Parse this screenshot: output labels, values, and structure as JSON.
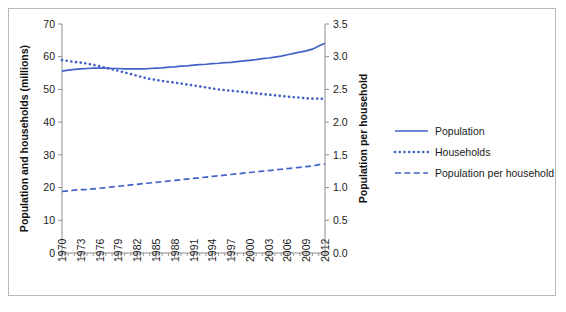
{
  "figure": {
    "border_color": "#b9b9b9",
    "background": "#ffffff",
    "axis_color": "#8d8d8d"
  },
  "chart_data": {
    "type": "line",
    "title": "",
    "subtitle": "",
    "xlabel": "",
    "ylabel": "Population and households (millions)",
    "y2label": "Population per household",
    "ylim": [
      0,
      70
    ],
    "y2lim": [
      0,
      3.5
    ],
    "xlim": [
      1970,
      2012
    ],
    "grid": false,
    "legend_position": "right",
    "y_ticks": [
      "0",
      "10",
      "20",
      "30",
      "40",
      "50",
      "60",
      "70"
    ],
    "y_tick_values": [
      0,
      10,
      20,
      30,
      40,
      50,
      60,
      70
    ],
    "y2_ticks": [
      "0.0",
      "0.5",
      "1.0",
      "1.5",
      "2.0",
      "2.5",
      "3.0",
      "3.5"
    ],
    "y2_tick_values": [
      0,
      0.5,
      1.0,
      1.5,
      2.0,
      2.5,
      3.0,
      3.5
    ],
    "x_tick_labels": [
      "1970",
      "1973",
      "1976",
      "1979",
      "1982",
      "1985",
      "1988",
      "1991",
      "1994",
      "1997",
      "2000",
      "2003",
      "2006",
      "2009",
      "2012"
    ],
    "x_tick_values": [
      1970,
      1973,
      1976,
      1979,
      1982,
      1985,
      1988,
      1991,
      1994,
      1997,
      2000,
      2003,
      2006,
      2009,
      2012
    ],
    "x": [
      1970,
      1971,
      1972,
      1973,
      1974,
      1975,
      1976,
      1977,
      1978,
      1979,
      1980,
      1981,
      1982,
      1983,
      1984,
      1985,
      1986,
      1987,
      1988,
      1989,
      1990,
      1991,
      1992,
      1993,
      1994,
      1995,
      1996,
      1997,
      1998,
      1999,
      2000,
      2001,
      2002,
      2003,
      2004,
      2005,
      2006,
      2007,
      2008,
      2009,
      2010,
      2011,
      2012
    ],
    "series": [
      {
        "name": "Population",
        "axis": "left",
        "style": "solid",
        "color": "#4262c8",
        "values": [
          55.6,
          55.9,
          56.1,
          56.3,
          56.4,
          56.5,
          56.5,
          56.5,
          56.4,
          56.4,
          56.3,
          56.3,
          56.3,
          56.3,
          56.4,
          56.5,
          56.6,
          56.8,
          56.9,
          57.1,
          57.2,
          57.4,
          57.6,
          57.7,
          57.9,
          58.0,
          58.2,
          58.3,
          58.5,
          58.7,
          58.9,
          59.1,
          59.4,
          59.6,
          59.9,
          60.2,
          60.6,
          61.0,
          61.4,
          61.8,
          62.3,
          63.3,
          64.1
        ]
      },
      {
        "name": "Households",
        "axis": "left",
        "style": "dotted",
        "color": "#4262c8",
        "values": [
          59.0,
          58.7,
          58.4,
          58.2,
          57.9,
          57.5,
          57.1,
          56.6,
          56.2,
          55.7,
          55.2,
          54.7,
          54.2,
          53.7,
          53.2,
          52.9,
          52.6,
          52.3,
          52.1,
          51.8,
          51.5,
          51.2,
          50.9,
          50.6,
          50.3,
          50.0,
          49.8,
          49.6,
          49.4,
          49.2,
          49.0,
          48.8,
          48.6,
          48.4,
          48.2,
          48.0,
          47.8,
          47.6,
          47.5,
          47.3,
          47.2,
          47.2,
          47.1
        ]
      },
      {
        "name": "Population per household",
        "axis": "right",
        "style": "dashed",
        "color": "#4262c8",
        "values": [
          0.94,
          0.95,
          0.96,
          0.97,
          0.97,
          0.98,
          0.99,
          1.0,
          1.01,
          1.02,
          1.03,
          1.04,
          1.05,
          1.06,
          1.07,
          1.08,
          1.09,
          1.1,
          1.11,
          1.12,
          1.13,
          1.14,
          1.15,
          1.16,
          1.17,
          1.18,
          1.19,
          1.2,
          1.21,
          1.22,
          1.23,
          1.24,
          1.25,
          1.26,
          1.27,
          1.28,
          1.29,
          1.3,
          1.31,
          1.32,
          1.33,
          1.35,
          1.36
        ]
      }
    ],
    "legend": [
      {
        "label": "Population",
        "style": "solid",
        "color": "#4262c8"
      },
      {
        "label": "Households",
        "style": "dotted",
        "color": "#4262c8"
      },
      {
        "label": "Population per household",
        "style": "dashed",
        "color": "#4262c8"
      }
    ]
  }
}
